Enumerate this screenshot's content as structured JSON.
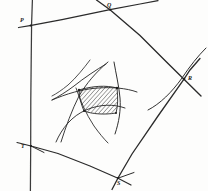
{
  "figure": {
    "width": 208,
    "height": 191,
    "background_color": "#fdfdfc",
    "ink_color": "#1c1c1c",
    "hatch_color": "#1c1c1c",
    "style": "hand-drawn pencil sketch"
  },
  "vertices": [
    {
      "id": "P",
      "label": "P",
      "x": 30,
      "y": 25,
      "label_x": 20,
      "label_y": 17
    },
    {
      "id": "Q",
      "label": "Q",
      "x": 110,
      "y": 9,
      "label_x": 107,
      "label_y": 2
    },
    {
      "id": "R",
      "label": "R",
      "x": 184,
      "y": 79,
      "label_x": 188,
      "label_y": 75
    },
    {
      "id": "S",
      "label": "S",
      "x": 118,
      "y": 178,
      "label_x": 117,
      "label_y": 180
    },
    {
      "id": "T",
      "label": "T",
      "x": 31,
      "y": 146,
      "label_x": 21,
      "label_y": 143
    }
  ],
  "edges": [
    {
      "id": "PQ",
      "from": "P",
      "to": "Q",
      "extends_beyond": "both"
    },
    {
      "id": "QR",
      "from": "Q",
      "to": "R",
      "extends_beyond": "both"
    },
    {
      "id": "RS",
      "from": "R",
      "to": "S",
      "extends_beyond": "both"
    },
    {
      "id": "ST",
      "from": "S",
      "to": "T",
      "extends_beyond": "both"
    },
    {
      "id": "TP",
      "from": "T",
      "to": "P",
      "extends_beyond": "both"
    }
  ],
  "interior": {
    "description": "Four curved arcs intersecting to bound a hatched curvilinear quadrilateral",
    "curve_count": 4,
    "hatched_region": {
      "name": "shaded-quadrilateral",
      "hatch_direction": "diagonal-45",
      "hatch_spacing_px": 2.2
    },
    "outer_arc": {
      "name": "right-arc",
      "description": "Separate arc passing near vertex R"
    }
  }
}
